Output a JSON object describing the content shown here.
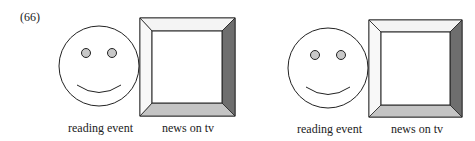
{
  "example_number": "(66)",
  "panels": [
    {
      "face_label": "reading event",
      "box_label": "news on tv"
    },
    {
      "face_label": "reading event",
      "box_label": "news on tv"
    }
  ],
  "colors": {
    "stroke": "#222222",
    "eye_fill": "#c8c8c8",
    "bevel_light": "#f4f4f4",
    "bevel_dark": "#6e6e6e",
    "bevel_bottom": "#c4c4c4"
  }
}
